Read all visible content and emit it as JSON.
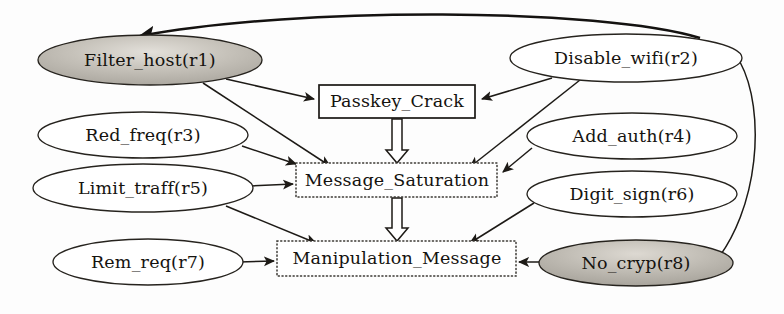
{
  "diagram": {
    "canvas": {
      "width": 784,
      "height": 314
    },
    "background_color": "#fdfdfd",
    "stroke_color": "#1d1a16",
    "shaded_fill_color": "#b9b5ad",
    "plain_fill_color": "#ffffff",
    "nodes": [
      {
        "id": "r1",
        "label": "Filter_host(r1)",
        "shape": "ellipse",
        "style": "shaded",
        "cx": 150,
        "cy": 60,
        "rx": 112,
        "ry": 25
      },
      {
        "id": "r2",
        "label": "Disable_wifi(r2)",
        "shape": "ellipse",
        "style": "plain",
        "cx": 626,
        "cy": 58,
        "rx": 116,
        "ry": 24
      },
      {
        "id": "r3",
        "label": "Red_freq(r3)",
        "shape": "ellipse",
        "style": "plain",
        "cx": 143,
        "cy": 135,
        "rx": 105,
        "ry": 23
      },
      {
        "id": "r4",
        "label": "Add_auth(r4)",
        "shape": "ellipse",
        "style": "plain",
        "cx": 632,
        "cy": 136,
        "rx": 105,
        "ry": 23
      },
      {
        "id": "r5",
        "label": "Limit_traff(r5)",
        "shape": "ellipse",
        "style": "plain",
        "cx": 143,
        "cy": 188,
        "rx": 110,
        "ry": 24
      },
      {
        "id": "r6",
        "label": "Digit_sign(r6)",
        "shape": "ellipse",
        "style": "plain",
        "cx": 632,
        "cy": 194,
        "rx": 105,
        "ry": 23
      },
      {
        "id": "r7",
        "label": "Rem_req(r7)",
        "shape": "ellipse",
        "style": "plain",
        "cx": 148,
        "cy": 262,
        "rx": 95,
        "ry": 23
      },
      {
        "id": "r8",
        "label": "No_cryp(r8)",
        "shape": "ellipse",
        "style": "shaded",
        "cx": 636,
        "cy": 263,
        "rx": 97,
        "ry": 23
      },
      {
        "id": "pc",
        "label": "Passkey_Crack",
        "shape": "rect-solid",
        "style": "solid",
        "x": 319,
        "y": 85,
        "w": 156,
        "h": 33
      },
      {
        "id": "ms",
        "label": "Message_Saturation",
        "shape": "rect-dotted",
        "style": "dotted",
        "x": 296,
        "y": 163,
        "w": 201,
        "h": 34
      },
      {
        "id": "mm",
        "label": "Manipulation_Message",
        "shape": "rect-dotted",
        "style": "dotted",
        "x": 277,
        "y": 241,
        "w": 239,
        "h": 35
      }
    ],
    "edges": [
      {
        "from": "r2",
        "to": "r1",
        "kind": "curved-thick",
        "description": "Disable_wifi(r2) curves over the top to Filter_host(r1)"
      },
      {
        "from": "r1",
        "to": "pc",
        "kind": "straight",
        "description": "Filter_host(r1) to Passkey_Crack"
      },
      {
        "from": "r1",
        "to": "ms",
        "kind": "straight",
        "description": "Filter_host(r1) to Message_Saturation"
      },
      {
        "from": "r2",
        "to": "pc",
        "kind": "straight",
        "description": "Disable_wifi(r2) to Passkey_Crack"
      },
      {
        "from": "r2",
        "to": "ms",
        "kind": "straight",
        "description": "Disable_wifi(r2) to Message_Saturation"
      },
      {
        "from": "r2",
        "to": "r8",
        "kind": "curved",
        "description": "Disable_wifi(r2) curves down the right edge to No_cryp(r8)"
      },
      {
        "from": "r3",
        "to": "ms",
        "kind": "straight",
        "description": "Red_freq(r3) to Message_Saturation"
      },
      {
        "from": "r4",
        "to": "ms",
        "kind": "straight",
        "description": "Add_auth(r4) to Message_Saturation"
      },
      {
        "from": "r5",
        "to": "ms",
        "kind": "straight",
        "description": "Limit_traff(r5) to Message_Saturation"
      },
      {
        "from": "r5",
        "to": "mm",
        "kind": "straight",
        "description": "Limit_traff(r5) to Manipulation_Message"
      },
      {
        "from": "r6",
        "to": "mm",
        "kind": "straight",
        "description": "Digit_sign(r6) to Manipulation_Message"
      },
      {
        "from": "r7",
        "to": "mm",
        "kind": "straight",
        "description": "Rem_req(r7) to Manipulation_Message"
      },
      {
        "from": "r8",
        "to": "mm",
        "kind": "straight",
        "description": "No_cryp(r8) to Manipulation_Message"
      },
      {
        "from": "pc",
        "to": "ms",
        "kind": "hollow",
        "description": "Passkey_Crack down to Message_Saturation"
      },
      {
        "from": "ms",
        "to": "mm",
        "kind": "hollow",
        "description": "Message_Saturation down to Manipulation_Message"
      }
    ]
  }
}
